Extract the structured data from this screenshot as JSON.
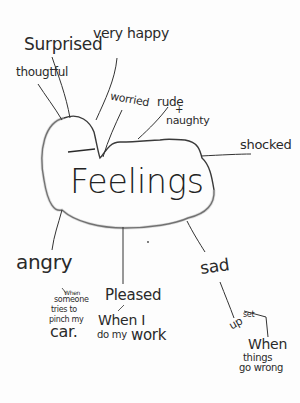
{
  "diagram": {
    "type": "mind-map",
    "style": "hand-drawn pencil on white paper",
    "center": {
      "label": "Feelings"
    },
    "branches": [
      {
        "label": "Surprised"
      },
      {
        "label": "very happy"
      },
      {
        "label": "thougtful"
      },
      {
        "label": "worried"
      },
      {
        "label": "rude + naughty",
        "line1": "rude",
        "line2": "+",
        "line3": "naughty"
      },
      {
        "label": "shocked"
      },
      {
        "label": "angry",
        "note": "When someone tries to pinch my car.",
        "note_lines": [
          "When",
          "someone",
          "tries to",
          "pinch my"
        ],
        "note_last": "car."
      },
      {
        "label": "Pleased",
        "note": "When I do my work",
        "note_line1": "When I",
        "note_line2": "do my",
        "note_line3": "work"
      },
      {
        "label": "sad",
        "sub": "upset",
        "sub_text": "up",
        "sub_text2": "set",
        "note": "When things go wrong",
        "note_line1": "When",
        "note_line2": "things",
        "note_line3": "go wrong"
      }
    ]
  },
  "colors": {
    "paper": "#fdfdfd",
    "pencil": "#2a2a2a",
    "shading": "#9a9a9a"
  }
}
